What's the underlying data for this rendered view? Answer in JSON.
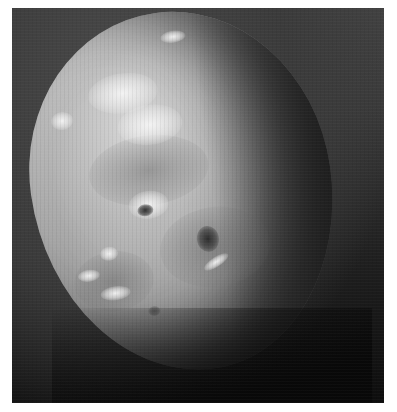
{
  "image": {
    "subject": "Grayscale spacecraft photograph of a cratered icy moon, partially lit, against dark space",
    "frame": {
      "background_color": "#3a3a3a",
      "shadow_color": "#0d0d0d"
    },
    "moon": {
      "surface_color": "#a5a5a5",
      "highlight_color": "#d8d8d8",
      "features": [
        {
          "type": "bright-region",
          "location": "upper-left"
        },
        {
          "type": "bright-region",
          "location": "upper-center"
        },
        {
          "type": "dark-crater",
          "location": "center-left"
        },
        {
          "type": "dark-crater",
          "location": "center"
        },
        {
          "type": "bright-streak",
          "location": "center"
        },
        {
          "type": "terminator-shadow",
          "location": "right"
        }
      ]
    }
  },
  "caption": {
    "text": ""
  }
}
